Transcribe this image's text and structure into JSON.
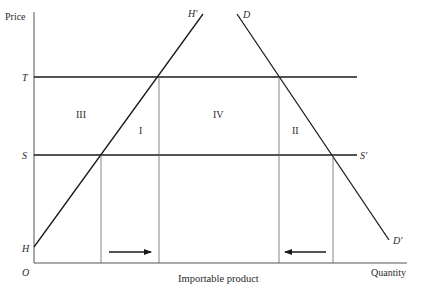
{
  "axes": {
    "y_label": "Price",
    "x_label": "Quantity",
    "origin_label": "O",
    "x_caption": "Importable product"
  },
  "price_levels": {
    "tariff_label": "T",
    "world_label": "S",
    "world_end_label": "S'"
  },
  "curves": {
    "supply_start_label": "H",
    "supply_end_label": "H'",
    "demand_start_label": "D",
    "demand_end_label": "D'"
  },
  "regions": {
    "r1": "I",
    "r2": "II",
    "r3": "III",
    "r4": "IV"
  },
  "arrows": {
    "left_direction": "right",
    "right_direction": "left"
  },
  "colors": {
    "line": "#1a1a1a",
    "thin_line": "#555555",
    "text": "#2a2a2a"
  }
}
